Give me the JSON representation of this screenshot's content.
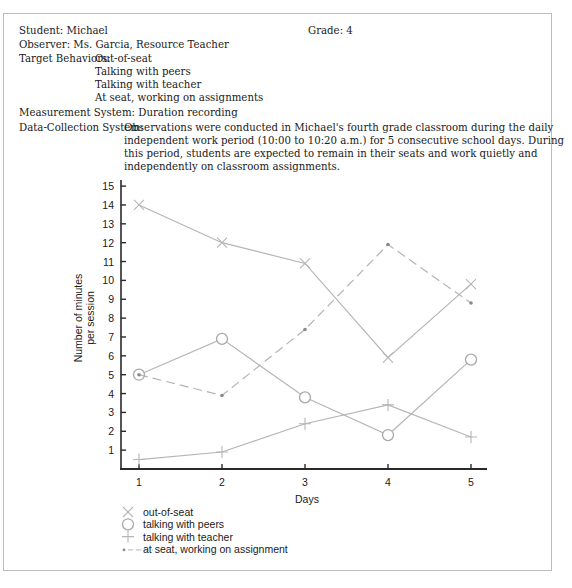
{
  "header": {
    "student_label": "Student: Michael",
    "grade_label": "Grade: 4",
    "observer_label": "Observer: Ms. Garcia, Resource Teacher",
    "target_behaviors_label": "Target Behaviors:",
    "target_behaviors": [
      "Out-of-seat",
      "Talking with peers",
      "Talking with teacher",
      "At seat, working on assignments"
    ],
    "measurement_label": "Measurement System: Duration recording",
    "data_collection_label": "Data-Collection System:",
    "data_collection_lines": [
      "Observations were conducted in Michael's fourth grade classroom during the daily",
      "independent work period (10:00 to 10:20 a.m.) for 5 consecutive school days. During",
      "this period, students are expected to remain in their seats and work quietly and",
      "independently on classroom assignments."
    ]
  },
  "chart_data": {
    "type": "line",
    "title": "",
    "xlabel": "Days",
    "ylabel": "Number of minutes per session",
    "ylabel_lines": [
      "Number of minutes",
      "per session"
    ],
    "x": [
      1,
      2,
      3,
      4,
      5
    ],
    "x_ticks": [
      "1",
      "2",
      "3",
      "4",
      "5"
    ],
    "y_ticks": [
      "1",
      "2",
      "3",
      "4",
      "5",
      "6",
      "7",
      "8",
      "9",
      "10",
      "11",
      "12",
      "13",
      "14",
      "15"
    ],
    "ylim": [
      0,
      15
    ],
    "grid": false,
    "legend_position": "below",
    "series": [
      {
        "name": "out-of-seat",
        "marker": "x",
        "style": "solid",
        "values": [
          14,
          12,
          10.9,
          5.9,
          9.8
        ]
      },
      {
        "name": "talking with peers",
        "marker": "circle",
        "style": "solid",
        "values": [
          5,
          6.9,
          3.8,
          1.8,
          5.8
        ]
      },
      {
        "name": "talking with teacher",
        "marker": "plus",
        "style": "solid",
        "values": [
          0.5,
          0.9,
          2.4,
          3.4,
          1.7
        ]
      },
      {
        "name": "at seat, working on assignment",
        "marker": "dot",
        "style": "dashed",
        "values": [
          5,
          3.9,
          7.4,
          11.9,
          8.8
        ]
      }
    ]
  },
  "legend": {
    "items": [
      {
        "symbol": "×",
        "label": "out-of-seat"
      },
      {
        "symbol": "○",
        "label": "talking with peers"
      },
      {
        "symbol": "+",
        "label": "talking with teacher"
      },
      {
        "symbol": "•– – –",
        "label": "at seat, working on assignment"
      }
    ]
  },
  "colors": {
    "series_line": "#b5b5b5",
    "axis": "#2a2a2a",
    "text": "#1a1a1a"
  }
}
